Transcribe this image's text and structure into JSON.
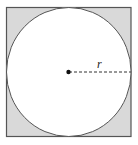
{
  "diagram": {
    "radius_label": "r",
    "colors": {
      "square_fill": "#d9d9d9",
      "circle_fill": "#ffffff",
      "stroke": "#555555",
      "center_dot": "#111111"
    }
  }
}
